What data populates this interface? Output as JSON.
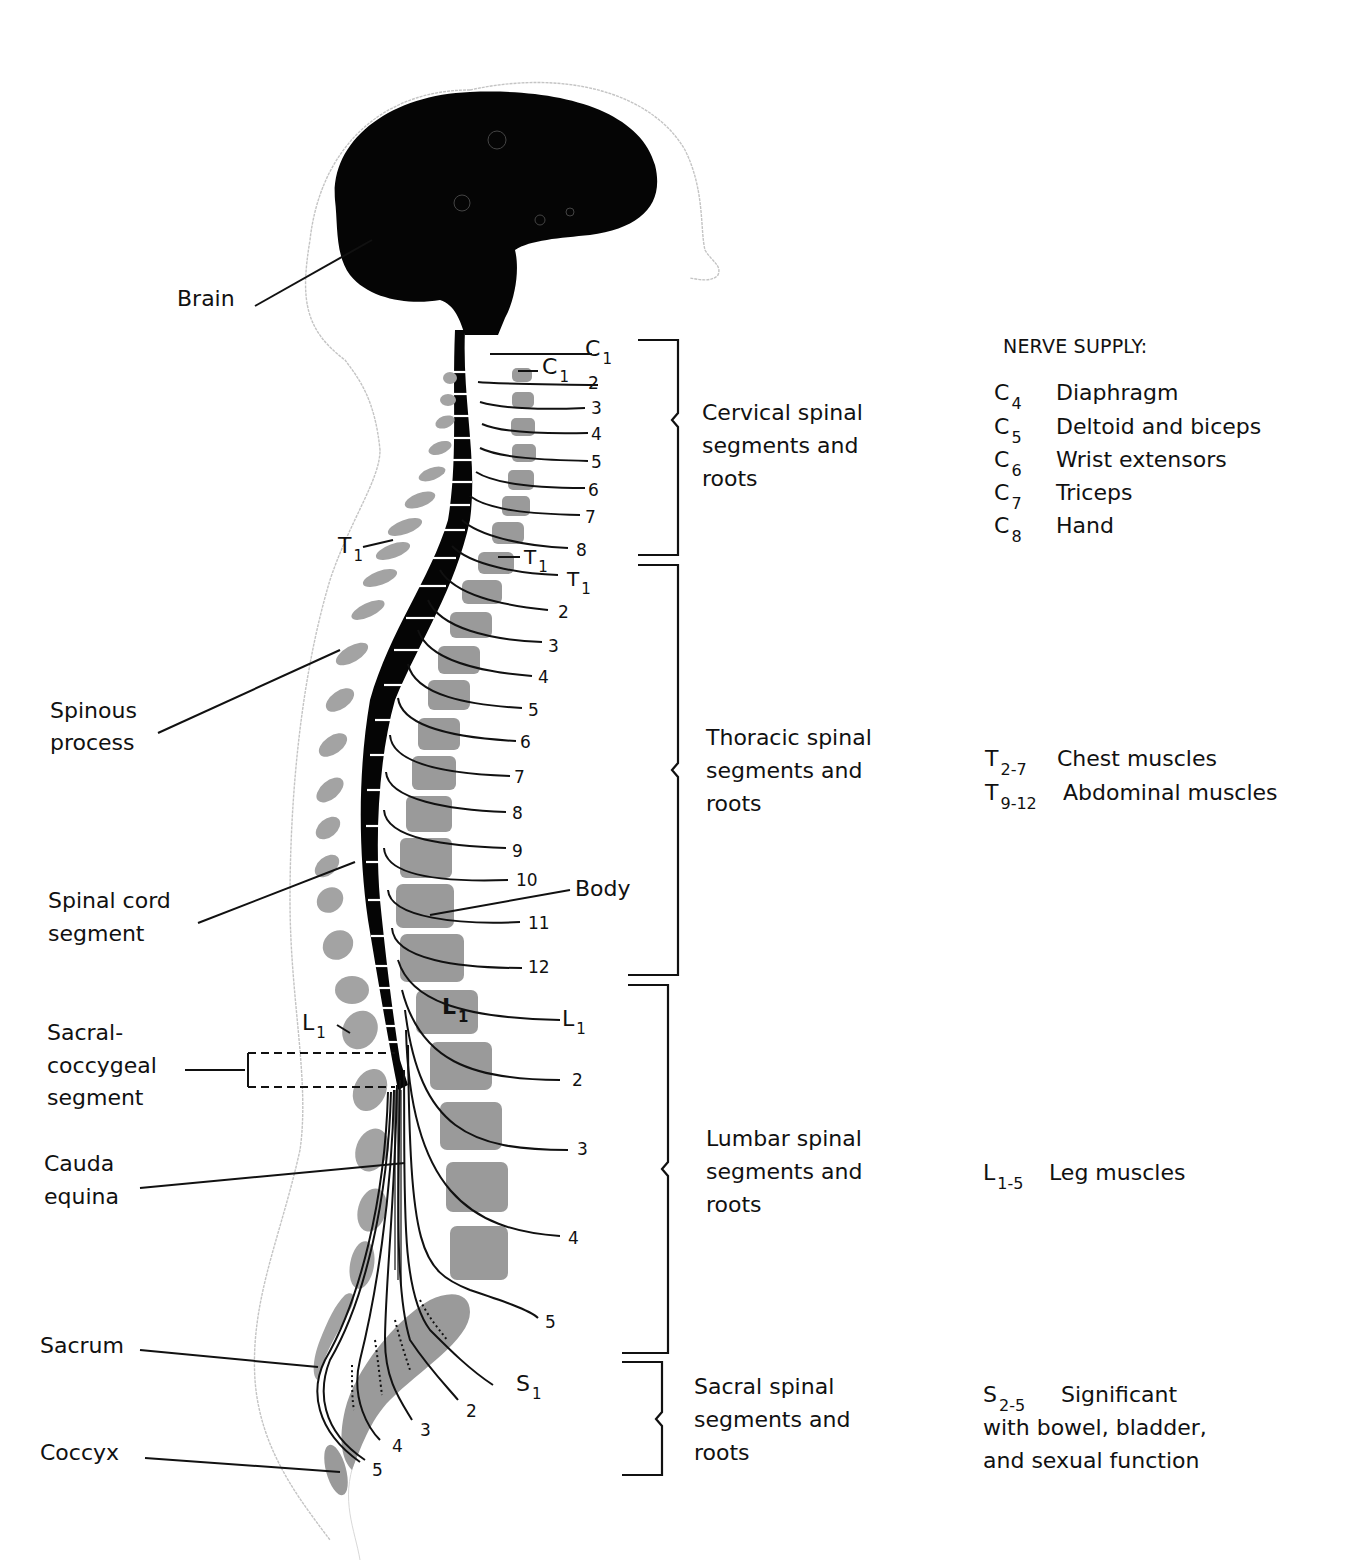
{
  "figure": {
    "type": "anatomical-diagram"
  },
  "left_labels": {
    "brain": "Brain",
    "spinous_process_1": "Spinous",
    "spinous_process_2": "process",
    "spinal_cord_segment_1": "Spinal cord",
    "spinal_cord_segment_2": "segment",
    "sacral_coccygeal_1": "Sacral-",
    "sacral_coccygeal_2": "coccygeal",
    "sacral_coccygeal_3": "segment",
    "cauda_equina_1": "Cauda",
    "cauda_equina_2": "equina",
    "sacrum": "Sacrum",
    "coccyx": "Coccyx"
  },
  "vertebra_labels": {
    "t1_spinous": {
      "letter": "T",
      "sub": "1"
    },
    "l1_spinous": {
      "letter": "L",
      "sub": "1"
    },
    "c1_body": {
      "letter": "C",
      "sub": "1"
    },
    "t1_body": {
      "letter": "T",
      "sub": "1"
    },
    "l1_body": {
      "letter": "L",
      "sub": "1"
    },
    "body": "Body"
  },
  "root_labels": {
    "cervical": [
      {
        "letter": "C",
        "sub": "1"
      },
      "2",
      "3",
      "4",
      "5",
      "6",
      "7",
      "8"
    ],
    "thoracic": [
      {
        "letter": "T",
        "sub": "1"
      },
      "2",
      "3",
      "4",
      "5",
      "6",
      "7",
      "8",
      "9",
      "10",
      "11",
      "12"
    ],
    "lumbar": [
      {
        "letter": "L",
        "sub": "1"
      },
      "2",
      "3",
      "4",
      "5"
    ],
    "sacral": [
      {
        "letter": "S",
        "sub": "1"
      },
      "2",
      "3",
      "4",
      "5"
    ]
  },
  "regions": [
    {
      "id": "cervical",
      "lines": [
        "Cervical spinal",
        "segments and",
        "roots"
      ]
    },
    {
      "id": "thoracic",
      "lines": [
        "Thoracic spinal",
        "segments and",
        "roots"
      ]
    },
    {
      "id": "lumbar",
      "lines": [
        "Lumbar spinal",
        "segments and",
        "roots"
      ]
    },
    {
      "id": "sacral",
      "lines": [
        "Sacral spinal",
        "segments and",
        "roots"
      ]
    }
  ],
  "nerve_supply": {
    "title": "NERVE SUPPLY:",
    "cervical": [
      {
        "letter": "C",
        "sub": "4",
        "text": "Diaphragm"
      },
      {
        "letter": "C",
        "sub": "5",
        "text": "Deltoid and biceps"
      },
      {
        "letter": "C",
        "sub": "6",
        "text": "Wrist extensors"
      },
      {
        "letter": "C",
        "sub": "7",
        "text": "Triceps"
      },
      {
        "letter": "C",
        "sub": "8",
        "text": "Hand"
      }
    ],
    "thoracic": [
      {
        "letter": "T",
        "sub": "2-7",
        "text": "Chest muscles"
      },
      {
        "letter": "T",
        "sub": "9-12",
        "text": "Abdominal muscles"
      }
    ],
    "lumbar": [
      {
        "letter": "L",
        "sub": "1-5",
        "text": "Leg muscles"
      }
    ],
    "sacral": {
      "letter": "S",
      "sub": "2-5",
      "lines": [
        "Significant",
        "with bowel, bladder,",
        "and sexual function"
      ]
    }
  },
  "colors": {
    "ink": "#111111",
    "bone": "#9a9a9a",
    "outline": "#bdbdbd",
    "background": "#ffffff"
  }
}
